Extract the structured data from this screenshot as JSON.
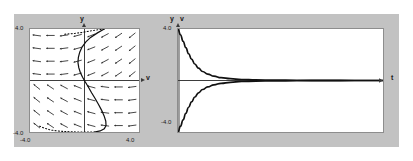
{
  "figure": {
    "background": "#ffffff",
    "plate_color": "#c2c2c2",
    "curve_color": "#111111",
    "axis_color": "#3a3a3a",
    "frame_color": "#8d8d8d"
  },
  "left_panel": {
    "name": "phase-plane-direction-field",
    "y_axis_label": "y",
    "x_axis_label": "v",
    "y_max_label": "4.0",
    "y_min_label": "-4.0",
    "x_min_label": "-4.0",
    "x_max_label": "4.0"
  },
  "right_panel": {
    "name": "time-series-plot",
    "y_label_1": "y",
    "y_label_2": "v",
    "t_axis_label": "t",
    "y_max_label": "4.0",
    "y_min_label": "-4.0"
  },
  "chart_data": [
    {
      "type": "scatter",
      "name": "phase-plane-direction-field",
      "title": "",
      "xlabel": "v",
      "ylabel": "y",
      "xlim": [
        -4.0,
        4.0
      ],
      "ylim": [
        -4.0,
        4.0
      ],
      "xticks": [
        -4.0,
        4.0
      ],
      "yticks": [
        -4.0,
        4.0
      ],
      "xticklabels": [
        "-4.0",
        "4.0"
      ],
      "yticklabels": [
        "-4.0",
        "4.0"
      ],
      "grid": false,
      "legend": false,
      "axes_through_origin": true,
      "field": {
        "description": "grid of small direction-field arrows",
        "grid_x": [
          -3.5,
          -2.5,
          -1.5,
          -0.5,
          0.5,
          1.5,
          2.5,
          3.5
        ],
        "grid_y": [
          3.5,
          2.5,
          1.5,
          0.5,
          -0.5,
          -1.5,
          -2.5,
          -3.5
        ],
        "arrow_length": 0.62
      },
      "trajectory": {
        "name": "solution-orbit",
        "style": "solid-with-dotted-tail",
        "points": [
          [
            1.45,
            4.0
          ],
          [
            0.95,
            3.7
          ],
          [
            0.45,
            3.35
          ],
          [
            0.1,
            3.0
          ],
          [
            -0.18,
            2.6
          ],
          [
            -0.35,
            2.2
          ],
          [
            -0.45,
            1.8
          ],
          [
            -0.48,
            1.4
          ],
          [
            -0.42,
            1.0
          ],
          [
            -0.3,
            0.6
          ],
          [
            -0.14,
            0.25
          ],
          [
            0.05,
            -0.1
          ],
          [
            0.28,
            -0.5
          ],
          [
            0.52,
            -0.95
          ],
          [
            0.78,
            -1.4
          ],
          [
            1.02,
            -1.85
          ],
          [
            1.25,
            -2.3
          ],
          [
            1.44,
            -2.75
          ],
          [
            1.56,
            -3.15
          ],
          [
            1.58,
            -3.5
          ],
          [
            1.45,
            -3.75
          ],
          [
            1.15,
            -3.92
          ],
          [
            0.72,
            -4.0
          ]
        ],
        "dotted_points": [
          [
            1.45,
            4.0
          ],
          [
            1.05,
            3.95
          ],
          [
            0.62,
            3.88
          ],
          [
            0.18,
            3.8
          ],
          [
            -0.26,
            3.72
          ],
          [
            -0.7,
            3.66
          ],
          [
            -1.15,
            3.62
          ],
          [
            -1.6,
            3.58
          ],
          [
            -3.3,
            -3.55
          ],
          [
            -2.9,
            -3.72
          ],
          [
            -2.45,
            -3.85
          ],
          [
            -2.0,
            -3.92
          ],
          [
            -1.5,
            -3.96
          ],
          [
            -1.0,
            -3.98
          ],
          [
            -0.5,
            -4.0
          ],
          [
            0.1,
            -4.0
          ],
          [
            0.72,
            -4.0
          ]
        ]
      }
    },
    {
      "type": "line",
      "name": "time-series-plot",
      "title": "",
      "xlabel": "t",
      "ylabel": "y, v",
      "ylim": [
        -4.0,
        4.0
      ],
      "yticks": [
        -4.0,
        4.0
      ],
      "yticklabels": [
        "-4.0",
        "4.0"
      ],
      "xlim": [
        0,
        10
      ],
      "xticks": [],
      "grid": false,
      "legend": false,
      "series": [
        {
          "name": "y",
          "x": [
            0.0,
            0.12,
            0.25,
            0.38,
            0.52,
            0.66,
            0.82,
            1.0,
            1.2,
            1.45,
            1.75,
            2.1,
            2.55,
            3.1,
            3.8,
            4.7,
            5.8,
            7.2,
            8.6,
            10.0
          ],
          "values": [
            4.0,
            3.55,
            3.05,
            2.55,
            2.08,
            1.66,
            1.28,
            0.96,
            0.7,
            0.5,
            0.34,
            0.22,
            0.14,
            0.08,
            0.05,
            0.03,
            0.02,
            0.01,
            0.0,
            0.0
          ]
        },
        {
          "name": "v",
          "x": [
            0.0,
            0.12,
            0.25,
            0.38,
            0.52,
            0.66,
            0.82,
            1.0,
            1.2,
            1.45,
            1.75,
            2.1,
            2.55,
            3.1,
            3.8,
            4.7,
            5.8,
            7.2,
            8.6,
            10.0
          ],
          "values": [
            -4.0,
            -3.55,
            -3.05,
            -2.55,
            -2.08,
            -1.66,
            -1.28,
            -0.96,
            -0.7,
            -0.5,
            -0.34,
            -0.22,
            -0.14,
            -0.08,
            -0.05,
            -0.03,
            -0.02,
            -0.01,
            0.0,
            0.0
          ]
        }
      ]
    }
  ]
}
